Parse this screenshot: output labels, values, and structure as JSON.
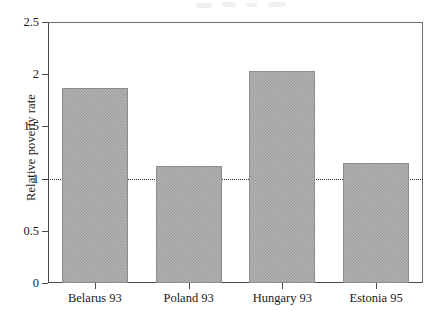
{
  "chart_data": {
    "type": "bar",
    "title": "",
    "xlabel": "",
    "ylabel": "Relative poverty rate",
    "categories": [
      "Belarus 93",
      "Poland 93",
      "Hungary 93",
      "Estonia 95"
    ],
    "values": [
      1.87,
      1.12,
      2.03,
      1.15
    ],
    "ylim": [
      0,
      2.5
    ],
    "ytick_labels": [
      "0",
      "0.5",
      "1",
      "1.5",
      "2",
      "2.5"
    ],
    "ytick_values": [
      0,
      0.5,
      1,
      1.5,
      2,
      2.5
    ],
    "grid": false,
    "legend": "none",
    "annotations": [
      {
        "type": "reference-line",
        "axis": "y",
        "value": 1,
        "style": "dotted"
      }
    ],
    "series": [
      {
        "name": "Relative poverty rate",
        "values": [
          1.87,
          1.12,
          2.03,
          1.15
        ],
        "fill": "#b3b3b3",
        "pattern": "checkered-gray",
        "edge_color": "#8c8c8c"
      }
    ],
    "colors": {
      "bar_fill": "#b3b3b3",
      "bar_pattern": "#9a9a9a",
      "bar_edge": "#8c8c8c",
      "axis": "#4a4a4a",
      "text": "#1a1a1a",
      "reference_line": "#2b2b2b",
      "background": "#ffffff"
    }
  }
}
